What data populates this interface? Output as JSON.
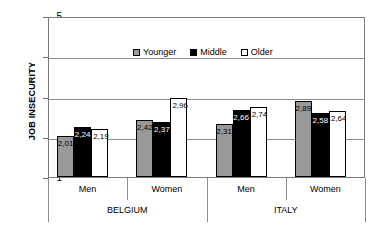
{
  "chart_data": {
    "type": "bar",
    "title": "",
    "xlabel": "",
    "ylabel": "JOB INSECURITY",
    "ylim": [
      1,
      5
    ],
    "yticks": [
      "1",
      "2",
      "3",
      "4",
      "5"
    ],
    "grid": true,
    "legend_position": "top-left-inside",
    "categories": [
      "Men",
      "Women",
      "Men",
      "Women"
    ],
    "groups": [
      {
        "name": "BELGIUM",
        "categories": [
          "Men",
          "Women"
        ]
      },
      {
        "name": "ITALY",
        "categories": [
          "Men",
          "Women"
        ]
      }
    ],
    "series": [
      {
        "name": "Younger",
        "color": "#999999",
        "values": [
          2.01,
          2.42,
          2.31,
          2.89
        ]
      },
      {
        "name": "Middle",
        "color": "#000000",
        "values": [
          2.24,
          2.37,
          2.66,
          2.58
        ]
      },
      {
        "name": "Older",
        "color": "#ffffff",
        "values": [
          2.19,
          2.96,
          2.74,
          2.64
        ]
      }
    ],
    "value_labels": [
      [
        "2,01",
        "2,42",
        "2,31",
        "2,89"
      ],
      [
        "2,24",
        "2,37",
        "2,66",
        "2,58"
      ],
      [
        "2,19",
        "2,96",
        "2,74",
        "2,64"
      ]
    ]
  },
  "legend": {
    "items": [
      {
        "label": "Younger",
        "color": "#999999"
      },
      {
        "label": "Middle",
        "color": "#000000"
      },
      {
        "label": "Older",
        "color": "#ffffff"
      }
    ]
  }
}
